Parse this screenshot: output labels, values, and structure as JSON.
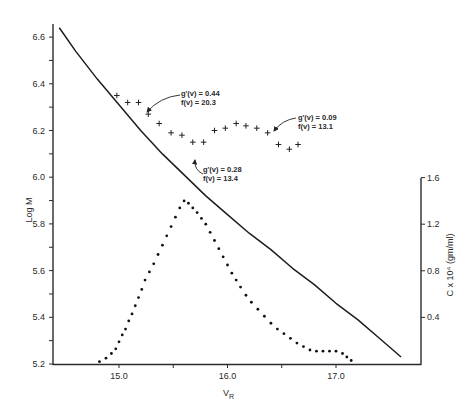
{
  "chart_data": {
    "type": "line",
    "title": "",
    "xlabel": "V_R",
    "xlabel_main": "V",
    "xlabel_sub": "R",
    "ylabel": "Log M",
    "ylabel_right": "C x 10⁴ (gm/ml)",
    "xlim": [
      14.4,
      17.8
    ],
    "ylim": [
      5.2,
      6.65
    ],
    "ylim_right": [
      0,
      1.6
    ],
    "x_ticks": [
      {
        "value": 15.0,
        "label": "15.0"
      },
      {
        "value": 15.5,
        "label": ""
      },
      {
        "value": 16.0,
        "label": "16.0"
      },
      {
        "value": 16.5,
        "label": ""
      },
      {
        "value": 17.0,
        "label": "17.0"
      }
    ],
    "y_ticks": [
      {
        "value": 6.6,
        "label": "6.6"
      },
      {
        "value": 6.5,
        "label": ""
      },
      {
        "value": 6.4,
        "label": "6.4"
      },
      {
        "value": 6.3,
        "label": ""
      },
      {
        "value": 6.2,
        "label": "6.2"
      },
      {
        "value": 6.1,
        "label": ""
      },
      {
        "value": 6.0,
        "label": "6.0"
      },
      {
        "value": 5.9,
        "label": ""
      },
      {
        "value": 5.8,
        "label": "5.8"
      },
      {
        "value": 5.7,
        "label": ""
      },
      {
        "value": 5.6,
        "label": "5.6"
      },
      {
        "value": 5.5,
        "label": ""
      },
      {
        "value": 5.4,
        "label": "5.4"
      },
      {
        "value": 5.3,
        "label": ""
      },
      {
        "value": 5.2,
        "label": "5.2"
      }
    ],
    "y_right_ticks": [
      {
        "value": 1.6,
        "label": "1.6"
      },
      {
        "value": 1.2,
        "label": "1.2"
      },
      {
        "value": 0.8,
        "label": "0.8"
      },
      {
        "value": 0.4,
        "label": "0.4"
      }
    ],
    "grid": false,
    "series": [
      {
        "name": "Calibration curve (Log M vs V_R)",
        "style": "solid-line",
        "axis": "left",
        "x": [
          14.45,
          14.6,
          14.8,
          15.0,
          15.2,
          15.4,
          15.6,
          15.8,
          16.0,
          16.2,
          16.4,
          16.6,
          16.8,
          17.0,
          17.2,
          17.4,
          17.6
        ],
        "y": [
          6.64,
          6.54,
          6.42,
          6.31,
          6.2,
          6.1,
          6.01,
          5.92,
          5.84,
          5.76,
          5.69,
          5.61,
          5.54,
          5.46,
          5.39,
          5.31,
          5.23
        ]
      },
      {
        "name": "Log M points (+)",
        "style": "plus-markers",
        "axis": "left",
        "x": [
          14.98,
          15.08,
          15.18,
          15.27,
          15.37,
          15.48,
          15.58,
          15.68,
          15.78,
          15.88,
          15.98,
          16.08,
          16.17,
          16.27,
          16.37,
          16.47,
          16.57,
          16.65
        ],
        "y": [
          6.35,
          6.32,
          6.32,
          6.27,
          6.23,
          6.19,
          6.18,
          6.15,
          6.15,
          6.2,
          6.21,
          6.23,
          6.22,
          6.21,
          6.19,
          6.14,
          6.12,
          6.14
        ]
      },
      {
        "name": "Concentration (C x 10⁴ gm/ml)",
        "style": "dotted",
        "axis": "right",
        "x": [
          14.82,
          14.88,
          14.93,
          14.97,
          15.0,
          15.03,
          15.06,
          15.09,
          15.12,
          15.15,
          15.18,
          15.21,
          15.24,
          15.28,
          15.32,
          15.36,
          15.4,
          15.44,
          15.48,
          15.52,
          15.56,
          15.6,
          15.64,
          15.68,
          15.72,
          15.76,
          15.8,
          15.84,
          15.88,
          15.92,
          15.96,
          16.0,
          16.04,
          16.08,
          16.12,
          16.17,
          16.22,
          16.28,
          16.34,
          16.4,
          16.46,
          16.52,
          16.58,
          16.64,
          16.7,
          16.76,
          16.82,
          16.88,
          16.94,
          17.0,
          17.06,
          17.1,
          17.14
        ],
        "y": [
          0.02,
          0.05,
          0.09,
          0.13,
          0.19,
          0.25,
          0.3,
          0.37,
          0.43,
          0.5,
          0.57,
          0.64,
          0.72,
          0.79,
          0.86,
          0.94,
          1.02,
          1.1,
          1.18,
          1.26,
          1.34,
          1.4,
          1.38,
          1.34,
          1.3,
          1.25,
          1.2,
          1.13,
          1.06,
          0.99,
          0.92,
          0.85,
          0.78,
          0.72,
          0.66,
          0.59,
          0.53,
          0.47,
          0.41,
          0.35,
          0.3,
          0.26,
          0.22,
          0.18,
          0.15,
          0.12,
          0.11,
          0.11,
          0.11,
          0.11,
          0.09,
          0.06,
          0.03
        ]
      }
    ],
    "annotations": [
      {
        "line1": "g'(v) = 0.44",
        "line2": "f(v) = 20.3",
        "x": 15.18,
        "y": 6.32
      },
      {
        "line1": "g'(v) = 0.28",
        "line2": "f(v) = 13.4",
        "x": 15.78,
        "y": 6.15
      },
      {
        "line1": "g'(v) = 0.09",
        "line2": "f(v) = 13.1",
        "x": 16.47,
        "y": 6.14
      }
    ]
  }
}
